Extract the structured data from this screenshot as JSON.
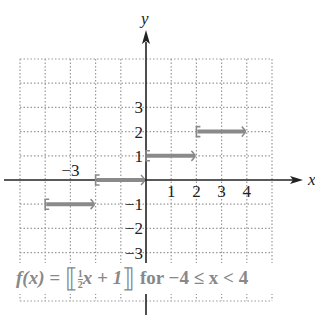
{
  "chart_data": {
    "type": "line",
    "title": "",
    "function_label": "f(x) = [[½x + 1]] for −4 ≤ x < 4",
    "function_parts": {
      "lhs": "f(x) = ",
      "numerator": "1",
      "denominator": "2",
      "rest": "x + 1",
      "domain": " for −4 ≤ x < 4"
    },
    "xlabel": "x",
    "ylabel": "y",
    "xlim": [
      -5,
      5
    ],
    "ylim": [
      -5,
      5
    ],
    "grid": true,
    "x_tick_labels": [
      {
        "value": -3,
        "label": "−3"
      },
      {
        "value": 1,
        "label": "1"
      },
      {
        "value": 2,
        "label": "2"
      },
      {
        "value": 3,
        "label": "3"
      },
      {
        "value": 4,
        "label": "4"
      }
    ],
    "y_tick_labels": [
      {
        "value": 3,
        "label": "3"
      },
      {
        "value": 2,
        "label": "2"
      },
      {
        "value": 1,
        "label": "1"
      },
      {
        "value": -1,
        "label": "−1"
      },
      {
        "value": -2,
        "label": "−2"
      },
      {
        "value": -3,
        "label": "−3"
      }
    ],
    "series": [
      {
        "name": "step function",
        "segments": [
          {
            "x_start": -4,
            "x_end": -2,
            "y": -1,
            "closed_left": true,
            "open_right": true
          },
          {
            "x_start": -2,
            "x_end": 0,
            "y": 0,
            "closed_left": true,
            "open_right": true
          },
          {
            "x_start": 0,
            "x_end": 2,
            "y": 1,
            "closed_left": true,
            "open_right": true
          },
          {
            "x_start": 2,
            "x_end": 4,
            "y": 2,
            "closed_left": true,
            "open_right": true
          }
        ]
      }
    ],
    "colors": {
      "segment": "#8a8a8a",
      "axis": "#222222",
      "grid": "#9a9a9a"
    }
  }
}
